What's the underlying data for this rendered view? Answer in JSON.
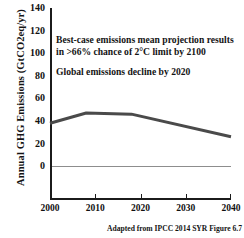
{
  "chart_data": {
    "type": "line",
    "title": "",
    "xlabel": "",
    "ylabel": "Annual GHG Emissions  (GtCO2eq/yr)",
    "x": [
      2000,
      2008,
      2018,
      2040
    ],
    "series": [
      {
        "name": "Best-case emissions mean projection",
        "values": [
          38,
          47,
          46,
          26
        ]
      }
    ],
    "xlim": [
      2000,
      2040
    ],
    "ylim": [
      -30,
      140
    ],
    "yticks": [
      0,
      20,
      40,
      60,
      80,
      100,
      120,
      140
    ],
    "ytick_labels": [
      "0",
      "20",
      "40",
      "60",
      "80",
      "100",
      "120",
      "140"
    ],
    "xticks": [
      2000,
      2010,
      2020,
      2030,
      2040
    ],
    "xtick_labels": [
      "2000",
      "2010",
      "2020",
      "2030",
      "2040"
    ],
    "grid": false,
    "zero_line": true,
    "legend": "none",
    "line_color": "#4a4a4a",
    "axis_color": "#1b1b1b",
    "zero_line_color": "#8d8d8d",
    "annotations": [
      "Best-case emissions mean projection results in >66% chance of 2°C limit by 2100",
      "Global emissions decline by 2020"
    ],
    "source": "Adapted from IPCC 2014 SYR Figure 6.7"
  },
  "annotation_lines": {
    "first": "Best-case emissions mean projection results in >66% chance of 2°C limit by 2100",
    "second": "Global emissions decline by 2020"
  }
}
